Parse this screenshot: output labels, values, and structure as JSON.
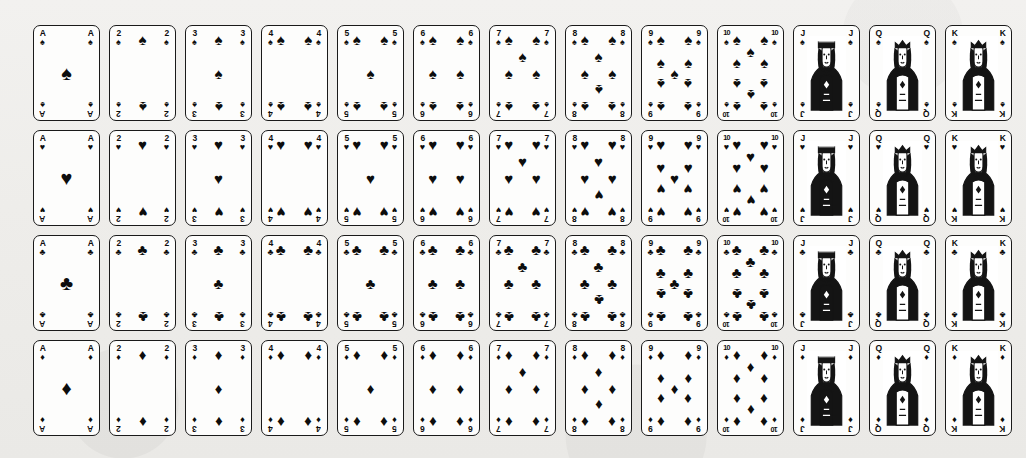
{
  "page": {
    "background_color": "#efeeec",
    "card_face_color": "#fdfdfc",
    "ink_color": "#0d0d0d",
    "card_count": 52,
    "rows": 4,
    "columns": 13
  },
  "suits": [
    {
      "key": "spades",
      "name": "Spades",
      "glyph": "♠",
      "color": "#0d0d0d",
      "row_index": 0
    },
    {
      "key": "hearts",
      "name": "Hearts",
      "glyph": "♥",
      "color": "#0d0d0d",
      "row_index": 1
    },
    {
      "key": "clubs",
      "name": "Clubs",
      "glyph": "♣",
      "color": "#0d0d0d",
      "row_index": 2
    },
    {
      "key": "diamonds",
      "name": "Diamonds",
      "glyph": "♦",
      "color": "#0d0d0d",
      "row_index": 3
    }
  ],
  "ranks": [
    {
      "key": "A",
      "label": "A",
      "name": "Ace",
      "pip_count": 1,
      "court": false
    },
    {
      "key": "2",
      "label": "2",
      "name": "Two",
      "pip_count": 2,
      "court": false
    },
    {
      "key": "3",
      "label": "3",
      "name": "Three",
      "pip_count": 3,
      "court": false
    },
    {
      "key": "4",
      "label": "4",
      "name": "Four",
      "pip_count": 4,
      "court": false
    },
    {
      "key": "5",
      "label": "5",
      "name": "Five",
      "pip_count": 5,
      "court": false
    },
    {
      "key": "6",
      "label": "6",
      "name": "Six",
      "pip_count": 6,
      "court": false
    },
    {
      "key": "7",
      "label": "7",
      "name": "Seven",
      "pip_count": 7,
      "court": false
    },
    {
      "key": "8",
      "label": "8",
      "name": "Eight",
      "pip_count": 8,
      "court": false
    },
    {
      "key": "9",
      "label": "9",
      "name": "Nine",
      "pip_count": 9,
      "court": false
    },
    {
      "key": "10",
      "label": "10",
      "name": "Ten",
      "pip_count": 10,
      "court": false
    },
    {
      "key": "J",
      "label": "J",
      "name": "Jack",
      "pip_count": 0,
      "court": true,
      "court_type": "jack"
    },
    {
      "key": "Q",
      "label": "Q",
      "name": "Queen",
      "pip_count": 0,
      "court": true,
      "court_type": "queen"
    },
    {
      "key": "K",
      "label": "K",
      "name": "King",
      "pip_count": 0,
      "court": true,
      "court_type": "king"
    }
  ],
  "pip_layouts": {
    "A": [
      [
        50,
        50,
        "big",
        false
      ]
    ],
    "2": [
      [
        50,
        8,
        "",
        false
      ],
      [
        50,
        92,
        "",
        true
      ]
    ],
    "3": [
      [
        50,
        8,
        "",
        false
      ],
      [
        50,
        50,
        "",
        false
      ],
      [
        50,
        92,
        "",
        true
      ]
    ],
    "4": [
      [
        18,
        8,
        "",
        false
      ],
      [
        82,
        8,
        "",
        false
      ],
      [
        18,
        92,
        "",
        true
      ],
      [
        82,
        92,
        "",
        true
      ]
    ],
    "5": [
      [
        18,
        8,
        "",
        false
      ],
      [
        82,
        8,
        "",
        false
      ],
      [
        50,
        50,
        "",
        false
      ],
      [
        18,
        92,
        "",
        true
      ],
      [
        82,
        92,
        "",
        true
      ]
    ],
    "6": [
      [
        18,
        8,
        "",
        false
      ],
      [
        82,
        8,
        "",
        false
      ],
      [
        18,
        50,
        "",
        false
      ],
      [
        82,
        50,
        "",
        false
      ],
      [
        18,
        92,
        "",
        true
      ],
      [
        82,
        92,
        "",
        true
      ]
    ],
    "7": [
      [
        18,
        8,
        "",
        false
      ],
      [
        82,
        8,
        "",
        false
      ],
      [
        50,
        29,
        "",
        false
      ],
      [
        18,
        50,
        "",
        false
      ],
      [
        82,
        50,
        "",
        false
      ],
      [
        18,
        92,
        "",
        true
      ],
      [
        82,
        92,
        "",
        true
      ]
    ],
    "8": [
      [
        18,
        8,
        "",
        false
      ],
      [
        82,
        8,
        "",
        false
      ],
      [
        50,
        29,
        "",
        false
      ],
      [
        18,
        50,
        "",
        false
      ],
      [
        82,
        50,
        "",
        false
      ],
      [
        50,
        71,
        "",
        true
      ],
      [
        18,
        92,
        "",
        true
      ],
      [
        82,
        92,
        "",
        true
      ]
    ],
    "9": [
      [
        18,
        8,
        "",
        false
      ],
      [
        82,
        8,
        "",
        false
      ],
      [
        18,
        36,
        "",
        false
      ],
      [
        82,
        36,
        "",
        false
      ],
      [
        50,
        50,
        "",
        false
      ],
      [
        18,
        64,
        "",
        true
      ],
      [
        82,
        64,
        "",
        true
      ],
      [
        18,
        92,
        "",
        true
      ],
      [
        82,
        92,
        "",
        true
      ]
    ],
    "10": [
      [
        18,
        8,
        "",
        false
      ],
      [
        82,
        8,
        "",
        false
      ],
      [
        50,
        22,
        "",
        false
      ],
      [
        18,
        36,
        "",
        false
      ],
      [
        82,
        36,
        "",
        false
      ],
      [
        18,
        64,
        "",
        true
      ],
      [
        82,
        64,
        "",
        true
      ],
      [
        50,
        78,
        "",
        true
      ],
      [
        18,
        92,
        "",
        true
      ],
      [
        82,
        92,
        "",
        true
      ]
    ]
  }
}
